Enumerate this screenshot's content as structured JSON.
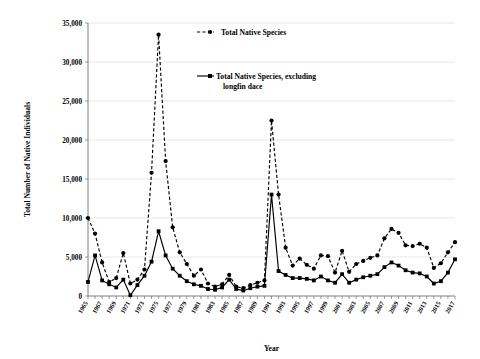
{
  "chart_data": {
    "type": "line",
    "title": "",
    "xlabel": "Year",
    "ylabel": "Total Number of Native Individuals",
    "xlim": [
      1965,
      2017
    ],
    "ylim": [
      0,
      35000
    ],
    "ytick_step": 5000,
    "grid": true,
    "legend_position": "top-center-right",
    "ytick_labels": [
      "0",
      "5,000",
      "10,000",
      "15,000",
      "20,000",
      "25,000",
      "30,000",
      "35,000"
    ],
    "ytick_values": [
      0,
      5000,
      10000,
      15000,
      20000,
      25000,
      30000,
      35000
    ],
    "xtick_labels": [
      "1965",
      "1967",
      "1969",
      "1971",
      "1973",
      "1975",
      "1977",
      "1979",
      "1981",
      "1983",
      "1985",
      "1987",
      "1989",
      "1991",
      "1993",
      "1995",
      "1997",
      "1999",
      "2001",
      "2003",
      "2005",
      "2007",
      "2009",
      "2011",
      "2013",
      "2015",
      "2017"
    ],
    "x": [
      1965,
      1966,
      1967,
      1968,
      1969,
      1970,
      1971,
      1972,
      1973,
      1974,
      1975,
      1976,
      1977,
      1978,
      1979,
      1980,
      1981,
      1982,
      1983,
      1984,
      1985,
      1986,
      1987,
      1988,
      1989,
      1990,
      1991,
      1992,
      1993,
      1994,
      1995,
      1996,
      1997,
      1998,
      1999,
      2000,
      2001,
      2002,
      2003,
      2004,
      2005,
      2006,
      2007,
      2008,
      2009,
      2010,
      2011,
      2012,
      2013,
      2014,
      2015,
      2016,
      2017
    ],
    "series": [
      {
        "name": "Total Native Species",
        "style": "dashed",
        "marker": "circle",
        "values": [
          10000,
          8000,
          4300,
          1800,
          2300,
          5500,
          1600,
          2100,
          3400,
          15800,
          33500,
          17300,
          8800,
          5600,
          4100,
          2600,
          3400,
          1600,
          1200,
          1500,
          2700,
          1200,
          1000,
          1400,
          1700,
          2000,
          22500,
          13000,
          6200,
          3900,
          4800,
          4000,
          3500,
          5200,
          5100,
          3000,
          5800,
          3100,
          4100,
          4500,
          4900,
          5200,
          7400,
          8600,
          8100,
          6500,
          6400,
          6700,
          6200,
          3600,
          4200,
          5600,
          6900
        ]
      },
      {
        "name": "Total Native Species, excluding longfin dace",
        "style": "solid",
        "marker": "square",
        "values": [
          1800,
          5200,
          2000,
          1500,
          1100,
          2100,
          100,
          1400,
          2600,
          4400,
          8300,
          5200,
          3500,
          2600,
          1900,
          1500,
          1300,
          900,
          800,
          1100,
          2100,
          900,
          700,
          1000,
          1200,
          1300,
          13000,
          3200,
          2700,
          2300,
          2300,
          2200,
          2000,
          2500,
          2000,
          1700,
          2800,
          1700,
          2100,
          2400,
          2600,
          2800,
          3700,
          4300,
          3900,
          3300,
          3000,
          2900,
          2500,
          1600,
          1900,
          3000,
          4700
        ]
      }
    ]
  },
  "legend": {
    "entries": [
      {
        "label": "Total Native Species"
      },
      {
        "label": "Total Native Species, excluding"
      },
      {
        "label": "longfin dace"
      }
    ]
  },
  "axes": {
    "x_title": "Year",
    "y_title": "Total Number of Native Individuals"
  },
  "colors": {
    "series": "#000000",
    "grid": "#d9d9d9",
    "axis": "#7f7f7f",
    "background": "#ffffff"
  }
}
